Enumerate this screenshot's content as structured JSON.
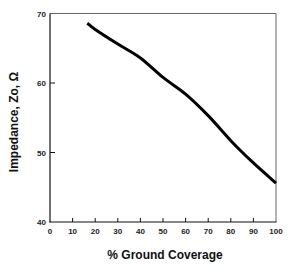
{
  "chart_data": {
    "type": "line",
    "title": "",
    "xlabel": "% Ground Coverage",
    "ylabel": "Impedance, Zo, Ω",
    "xlim": [
      0,
      100
    ],
    "ylim": [
      40,
      70
    ],
    "xticks": [
      0,
      10,
      20,
      30,
      40,
      50,
      60,
      70,
      80,
      90,
      100
    ],
    "yticks": [
      40,
      50,
      60,
      70
    ],
    "grid": false,
    "legend": null,
    "series": [
      {
        "name": "Impedance",
        "color": "#000000",
        "x": [
          16.5,
          20,
          30,
          40,
          50,
          60,
          70,
          80,
          90,
          100
        ],
        "y": [
          68.6,
          67.7,
          65.6,
          63.6,
          60.8,
          58.4,
          55.3,
          51.7,
          48.5,
          45.6
        ]
      }
    ]
  }
}
